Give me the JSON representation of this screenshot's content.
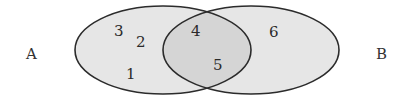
{
  "diagram": {
    "type": "venn",
    "sets": [
      {
        "name": "A",
        "elements_only": [
          "3",
          "2",
          "1"
        ]
      },
      {
        "name": "B",
        "elements_only": [
          "6"
        ]
      }
    ],
    "intersection": [
      "4",
      "5"
    ],
    "labels": {
      "A": "A",
      "B": "B"
    },
    "numbers": {
      "n1": "1",
      "n2": "2",
      "n3": "3",
      "n4": "4",
      "n5": "5",
      "n6": "6"
    },
    "colors": {
      "set_fill": "#e6e6e6",
      "intersection_fill": "#d6d6d6",
      "stroke": "#2b2b2b"
    }
  }
}
